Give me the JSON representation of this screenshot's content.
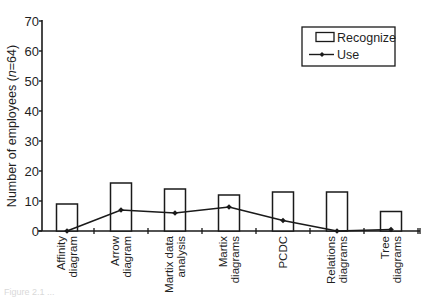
{
  "chart_data": {
    "type": "bar",
    "title": "",
    "xlabel": "",
    "ylabel": "Number of employees (n=64)",
    "ylabel_parts": {
      "prefix": "Number of employees (",
      "italic": "n",
      "suffix": "=64)"
    },
    "ylim": [
      0,
      70
    ],
    "yticks": [
      0,
      10,
      20,
      30,
      40,
      50,
      60,
      70
    ],
    "grid": false,
    "legend_position": "upper right",
    "categories": [
      [
        "Affinity",
        "diagram"
      ],
      [
        "Arrow",
        "diagram"
      ],
      [
        "Martix data",
        "analysis"
      ],
      [
        "Martix",
        "diagrams"
      ],
      [
        "PCDC"
      ],
      [
        "Relations",
        "diagrams"
      ],
      [
        "Tree",
        "diagrams"
      ]
    ],
    "category_names": [
      "Affinity diagram",
      "Arrow diagram",
      "Martix data analysis",
      "Martix diagrams",
      "PCDC",
      "Relations diagrams",
      "Tree diagrams"
    ],
    "series": [
      {
        "name": "Recognize",
        "kind": "bar",
        "values": [
          9,
          16,
          14,
          12,
          13,
          13,
          6.5
        ]
      },
      {
        "name": "Use",
        "kind": "line",
        "values": [
          0,
          7,
          6,
          8,
          3.5,
          0,
          0.5
        ]
      }
    ]
  },
  "legend": {
    "items": [
      {
        "label": "Recognize",
        "symbol": "open-box"
      },
      {
        "label": "Use",
        "symbol": "line-with-diamond"
      }
    ]
  },
  "caption": "Figure 2.1 ..."
}
